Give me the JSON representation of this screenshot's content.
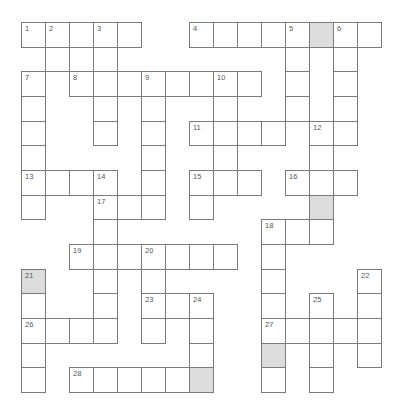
{
  "puzzle": {
    "cols": 15,
    "rows": 15,
    "cell_width": 24,
    "cell_height": 24.67,
    "colors": {
      "border": "#7a7a7a",
      "shaded": "#dcdcdc",
      "cell": "#ffffff",
      "number": "#555555"
    },
    "cells": [
      {
        "r": 0,
        "c": 0,
        "n": "1"
      },
      {
        "r": 0,
        "c": 1,
        "n": "2"
      },
      {
        "r": 0,
        "c": 2
      },
      {
        "r": 0,
        "c": 3,
        "n": "3"
      },
      {
        "r": 0,
        "c": 4
      },
      {
        "r": 0,
        "c": 7,
        "n": "4"
      },
      {
        "r": 0,
        "c": 8
      },
      {
        "r": 0,
        "c": 9
      },
      {
        "r": 0,
        "c": 10
      },
      {
        "r": 0,
        "c": 11,
        "n": "5"
      },
      {
        "r": 0,
        "c": 12,
        "shaded": true
      },
      {
        "r": 0,
        "c": 13,
        "n": "6"
      },
      {
        "r": 0,
        "c": 14
      },
      {
        "r": 1,
        "c": 1
      },
      {
        "r": 1,
        "c": 3
      },
      {
        "r": 1,
        "c": 11
      },
      {
        "r": 1,
        "c": 13
      },
      {
        "r": 2,
        "c": 0,
        "n": "7"
      },
      {
        "r": 2,
        "c": 2,
        "n": "8"
      },
      {
        "r": 2,
        "c": 3
      },
      {
        "r": 2,
        "c": 4
      },
      {
        "r": 2,
        "c": 5,
        "n": "9"
      },
      {
        "r": 2,
        "c": 6
      },
      {
        "r": 2,
        "c": 7
      },
      {
        "r": 2,
        "c": 8,
        "n": "10"
      },
      {
        "r": 2,
        "c": 9
      },
      {
        "r": 2,
        "c": 11
      },
      {
        "r": 2,
        "c": 13
      },
      {
        "r": 3,
        "c": 0
      },
      {
        "r": 3,
        "c": 3
      },
      {
        "r": 3,
        "c": 5
      },
      {
        "r": 3,
        "c": 8
      },
      {
        "r": 3,
        "c": 11
      },
      {
        "r": 3,
        "c": 13
      },
      {
        "r": 4,
        "c": 0
      },
      {
        "r": 4,
        "c": 3
      },
      {
        "r": 4,
        "c": 5
      },
      {
        "r": 4,
        "c": 7,
        "n": "11"
      },
      {
        "r": 4,
        "c": 8
      },
      {
        "r": 4,
        "c": 9
      },
      {
        "r": 4,
        "c": 10
      },
      {
        "r": 4,
        "c": 12,
        "n": "12"
      },
      {
        "r": 4,
        "c": 13
      },
      {
        "r": 5,
        "c": 0
      },
      {
        "r": 5,
        "c": 5
      },
      {
        "r": 5,
        "c": 8
      },
      {
        "r": 5,
        "c": 12
      },
      {
        "r": 6,
        "c": 0,
        "n": "13"
      },
      {
        "r": 6,
        "c": 1
      },
      {
        "r": 6,
        "c": 2
      },
      {
        "r": 6,
        "c": 3,
        "n": "14"
      },
      {
        "r": 6,
        "c": 5
      },
      {
        "r": 6,
        "c": 7,
        "n": "15"
      },
      {
        "r": 6,
        "c": 8
      },
      {
        "r": 6,
        "c": 9
      },
      {
        "r": 6,
        "c": 11,
        "n": "16"
      },
      {
        "r": 6,
        "c": 12
      },
      {
        "r": 6,
        "c": 13
      },
      {
        "r": 7,
        "c": 0
      },
      {
        "r": 7,
        "c": 3,
        "n": "17"
      },
      {
        "r": 7,
        "c": 4
      },
      {
        "r": 7,
        "c": 5
      },
      {
        "r": 7,
        "c": 7
      },
      {
        "r": 7,
        "c": 12,
        "shaded": true
      },
      {
        "r": 8,
        "c": 3
      },
      {
        "r": 8,
        "c": 10,
        "n": "18"
      },
      {
        "r": 8,
        "c": 11
      },
      {
        "r": 8,
        "c": 12
      },
      {
        "r": 9,
        "c": 2,
        "n": "19"
      },
      {
        "r": 9,
        "c": 3
      },
      {
        "r": 9,
        "c": 4
      },
      {
        "r": 9,
        "c": 5,
        "n": "20"
      },
      {
        "r": 9,
        "c": 6
      },
      {
        "r": 9,
        "c": 7
      },
      {
        "r": 9,
        "c": 8
      },
      {
        "r": 9,
        "c": 10
      },
      {
        "r": 10,
        "c": 0,
        "n": "21",
        "shaded": true
      },
      {
        "r": 10,
        "c": 3
      },
      {
        "r": 10,
        "c": 5
      },
      {
        "r": 10,
        "c": 10
      },
      {
        "r": 10,
        "c": 14,
        "n": "22"
      },
      {
        "r": 11,
        "c": 0
      },
      {
        "r": 11,
        "c": 3
      },
      {
        "r": 11,
        "c": 5,
        "n": "23"
      },
      {
        "r": 11,
        "c": 6
      },
      {
        "r": 11,
        "c": 7,
        "n": "24"
      },
      {
        "r": 11,
        "c": 10
      },
      {
        "r": 11,
        "c": 12,
        "n": "25"
      },
      {
        "r": 11,
        "c": 14
      },
      {
        "r": 12,
        "c": 0,
        "n": "26"
      },
      {
        "r": 12,
        "c": 1
      },
      {
        "r": 12,
        "c": 2
      },
      {
        "r": 12,
        "c": 3
      },
      {
        "r": 12,
        "c": 5
      },
      {
        "r": 12,
        "c": 7
      },
      {
        "r": 12,
        "c": 10,
        "n": "27"
      },
      {
        "r": 12,
        "c": 11
      },
      {
        "r": 12,
        "c": 12
      },
      {
        "r": 12,
        "c": 13
      },
      {
        "r": 12,
        "c": 14
      },
      {
        "r": 13,
        "c": 0
      },
      {
        "r": 13,
        "c": 7
      },
      {
        "r": 13,
        "c": 10,
        "shaded": true
      },
      {
        "r": 13,
        "c": 12
      },
      {
        "r": 13,
        "c": 14
      },
      {
        "r": 14,
        "c": 0
      },
      {
        "r": 14,
        "c": 2,
        "n": "28"
      },
      {
        "r": 14,
        "c": 3
      },
      {
        "r": 14,
        "c": 4
      },
      {
        "r": 14,
        "c": 5
      },
      {
        "r": 14,
        "c": 6
      },
      {
        "r": 14,
        "c": 7,
        "shaded": true
      },
      {
        "r": 14,
        "c": 10
      },
      {
        "r": 14,
        "c": 12
      }
    ]
  }
}
